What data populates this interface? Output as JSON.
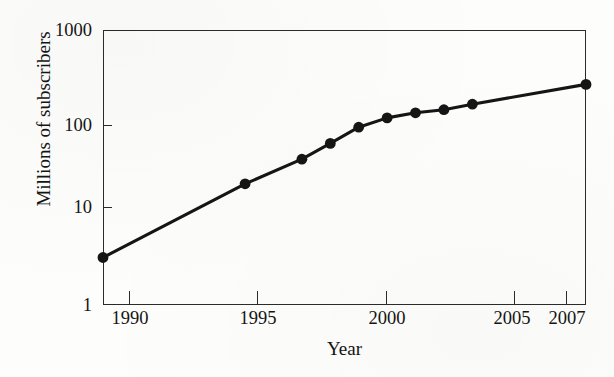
{
  "chart_data": {
    "type": "line",
    "title": "",
    "xlabel": "Year",
    "ylabel": "Millions of subscribers",
    "yscale": "log",
    "ylim": [
      1,
      1000
    ],
    "xlim": [
      1990,
      2007
    ],
    "grid": false,
    "legend": "none",
    "y_tick_labels": [
      "1000",
      "100",
      "10",
      "1"
    ],
    "y_tick_values": [
      1000,
      100,
      10,
      1
    ],
    "x_tick_labels": [
      "1990",
      "1995",
      "2000",
      "2005",
      "2007"
    ],
    "x_tick_values": [
      1990,
      1995,
      2000,
      2005,
      2007
    ],
    "marker": "filled-circle",
    "series": [
      {
        "name": "Mobile subscribers",
        "x": [
          1990,
          1995,
          1997,
          1998,
          1999,
          2000,
          2001,
          2002,
          2003,
          2007
        ],
        "values": [
          3.3,
          21,
          39,
          58,
          87,
          110,
          125,
          135,
          155,
          255
        ]
      }
    ],
    "points": [
      {
        "year": "1990",
        "value": "3.3"
      },
      {
        "year": "1995",
        "value": "21"
      },
      {
        "year": "1997",
        "value": "39"
      },
      {
        "year": "1998",
        "value": "58"
      },
      {
        "year": "1999",
        "value": "87"
      },
      {
        "year": "2000",
        "value": "110"
      },
      {
        "year": "2001",
        "value": "125"
      },
      {
        "year": "2002",
        "value": "135"
      },
      {
        "year": "2003",
        "value": "155"
      },
      {
        "year": "2007",
        "value": "255"
      }
    ],
    "colors": {
      "line": "#151515",
      "marker": "#151515",
      "axis": "#2b2b2b",
      "background": "#fdfdfb"
    }
  }
}
